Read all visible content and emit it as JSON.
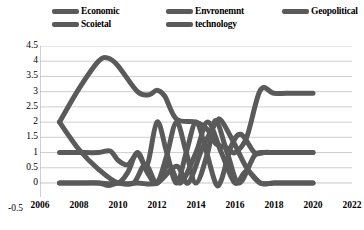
{
  "legend": {
    "position": "top",
    "color": "#5a5a5a",
    "items": [
      {
        "label": "Economic",
        "icon": "legend-line-swatch"
      },
      {
        "label": "Scoietal",
        "icon": "legend-line-swatch"
      },
      {
        "label": "Envronemnt",
        "icon": "legend-line-swatch"
      },
      {
        "label": "technology",
        "icon": "legend-line-swatch"
      },
      {
        "label": "Geopolitical",
        "icon": "legend-line-swatch"
      }
    ]
  },
  "axes": {
    "y_ticks": [
      "4.5",
      "4",
      "3.5",
      "3",
      "2.5",
      "2",
      "1.5",
      "1",
      "0.5",
      "0"
    ],
    "y_tick_negative": "-0.5",
    "x_ticks": [
      "2006",
      "2008",
      "2010",
      "2012",
      "2014",
      "2016",
      "2018",
      "2020",
      "2022"
    ]
  },
  "chart_data": {
    "type": "line",
    "title": "",
    "xlabel": "",
    "ylabel": "",
    "xlim": [
      2006,
      2022
    ],
    "ylim": [
      -0.5,
      4.5
    ],
    "ytick_step": 0.5,
    "xtick_step": 2,
    "grid": true,
    "grid_color": "#c8c8c8",
    "line_color": "#5a5a5a",
    "line_width": 5,
    "legend": "top",
    "series": [
      {
        "name": "Economic",
        "x": [
          2007,
          2008,
          2009,
          2009.5,
          2010,
          2011,
          2011.6,
          2012,
          2012.4,
          2013,
          2014,
          2014.6,
          2015,
          2015.6,
          2016,
          2016.6,
          2017.3,
          2018,
          2019,
          2020
        ],
        "values": [
          2,
          3.1,
          4.0,
          4.1,
          3.85,
          3.0,
          2.9,
          3.05,
          2.85,
          2.1,
          2.0,
          1.75,
          1.3,
          1.15,
          1.0,
          1.5,
          3.05,
          2.95,
          2.95,
          2.95
        ]
      },
      {
        "name": "Scoietal",
        "x": [
          2007,
          2008,
          2009,
          2009.6,
          2010,
          2010.5,
          2011,
          2011.5,
          2012,
          2012.5,
          2013,
          2013.5,
          2014,
          2014.5,
          2015,
          2015.3,
          2015.8,
          2016.3,
          2017,
          2017.5,
          2018,
          2019,
          2020
        ],
        "values": [
          1,
          1,
          1,
          1.05,
          0.75,
          0.6,
          0.95,
          0.6,
          2.0,
          1.0,
          0.0,
          1.0,
          2.0,
          1.1,
          0.0,
          0.1,
          1.2,
          1.6,
          1.0,
          1.0,
          1.0,
          1.0,
          1.0
        ]
      },
      {
        "name": "Envronemnt",
        "x": [
          2007,
          2008,
          2009,
          2010,
          2010.5,
          2011,
          2011.5,
          2012,
          2012.5,
          2013,
          2013.5,
          2014,
          2014.6,
          2015,
          2015.6,
          2016.2,
          2017,
          2017.5,
          2018,
          2019,
          2020
        ],
        "values": [
          0,
          0,
          0,
          0.0,
          0.35,
          1.0,
          0.35,
          0.0,
          0.9,
          2.0,
          1.0,
          0.0,
          1.0,
          2.05,
          1.0,
          0.0,
          0.9,
          1.0,
          1.0,
          1.0,
          1.0
        ]
      },
      {
        "name": "technology",
        "x": [
          2007,
          2008,
          2009,
          2009.5,
          2010,
          2010.8,
          2011.4,
          2012,
          2012.6,
          2013.2,
          2014,
          2014.6,
          2015.3,
          2016,
          2016.6,
          2017.3,
          2018,
          2019,
          2020
        ],
        "values": [
          0,
          0,
          0,
          -0.08,
          0.0,
          0.0,
          0.6,
          0.0,
          0.6,
          0.0,
          1.0,
          2.0,
          1.0,
          0.0,
          0.4,
          0.0,
          0.0,
          0.0,
          0.0
        ]
      },
      {
        "name": "Geopolitical",
        "x": [
          2007,
          2008,
          2009,
          2010,
          2011,
          2012,
          2013,
          2013.6,
          2014.3,
          2015,
          2015.3,
          2016,
          2016.6,
          2017.3,
          2018,
          2019,
          2020
        ],
        "values": [
          2,
          1.1,
          0.45,
          0.0,
          0.0,
          0.0,
          0.55,
          0.0,
          1.1,
          1.95,
          2.05,
          1.25,
          0.5,
          0.0,
          0.0,
          0.0,
          0.0
        ]
      }
    ]
  }
}
